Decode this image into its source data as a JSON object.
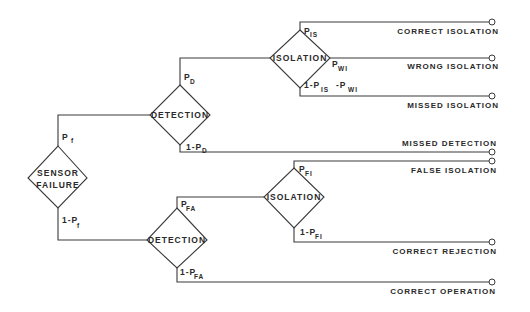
{
  "nodes": {
    "sensor_failure": {
      "line1": "SENSOR",
      "line2": "FAILURE"
    },
    "detection_upper": {
      "label": "DETECTION"
    },
    "isolation_upper": {
      "label": "ISOLATION"
    },
    "detection_lower": {
      "label": "DETECTION"
    },
    "isolation_lower": {
      "label": "ISOLATION"
    }
  },
  "branches": {
    "pf": {
      "main": "P",
      "sub": "f"
    },
    "one_minus_pf": {
      "main": "1-P",
      "sub": "f"
    },
    "pd": {
      "main": "P",
      "sub": "D"
    },
    "one_minus_pd": {
      "main": "1-P",
      "sub": "D"
    },
    "pis": {
      "main": "P",
      "sub": "IS"
    },
    "pwi": {
      "main": "P",
      "sub": "WI"
    },
    "missed_iso": {
      "main1": "1-P",
      "sub1": "IS",
      "main2": "-P",
      "sub2": "WI"
    },
    "pfa": {
      "main": "P",
      "sub": "FA"
    },
    "one_minus_pfa": {
      "main": "1-P",
      "sub": "FA"
    },
    "pfi": {
      "main": "P",
      "sub": "FI"
    },
    "one_minus_pfi": {
      "main": "1-P",
      "sub": "FI"
    }
  },
  "outcomes": [
    "CORRECT ISOLATION",
    "WRONG ISOLATION",
    "MISSED ISOLATION",
    "MISSED DETECTION",
    "FALSE ISOLATION",
    "CORRECT REJECTION",
    "CORRECT OPERATION"
  ]
}
